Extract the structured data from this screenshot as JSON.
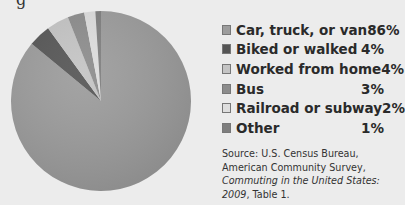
{
  "title_fragment": "g",
  "chart_data": {
    "type": "pie",
    "title": "",
    "categories": [
      "Car, truck, or van",
      "Biked or walked",
      "Worked from home",
      "Bus",
      "Railroad or subway",
      "Other"
    ],
    "values": [
      86,
      4,
      4,
      3,
      2,
      1
    ],
    "value_labels": [
      "86%",
      "4%",
      "4%",
      "3%",
      "2%",
      "1%"
    ],
    "colors": [
      "#9c9c9c",
      "#555555",
      "#c4c4c4",
      "#8c8c8c",
      "#dedede",
      "#7e7e7e"
    ],
    "legend_position": "right",
    "units": "percent"
  },
  "legend": [
    {
      "label": "Car, truck, or van",
      "value": "86%",
      "color": "#9c9c9c"
    },
    {
      "label": "Biked or walked",
      "value": "4%",
      "color": "#555555"
    },
    {
      "label": "Worked from home",
      "value": "4%",
      "color": "#c4c4c4"
    },
    {
      "label": "Bus",
      "value": "3%",
      "color": "#8c8c8c"
    },
    {
      "label": "Railroad or subway",
      "value": "2%",
      "color": "#dedede"
    },
    {
      "label": "Other",
      "value": "1%",
      "color": "#7e7e7e"
    }
  ],
  "source": {
    "prefix": "Source: U.S. Census Bureau, American Community Survey, ",
    "title_italic": "Commuting in the United States: 2009",
    "suffix": ", Table 1."
  }
}
